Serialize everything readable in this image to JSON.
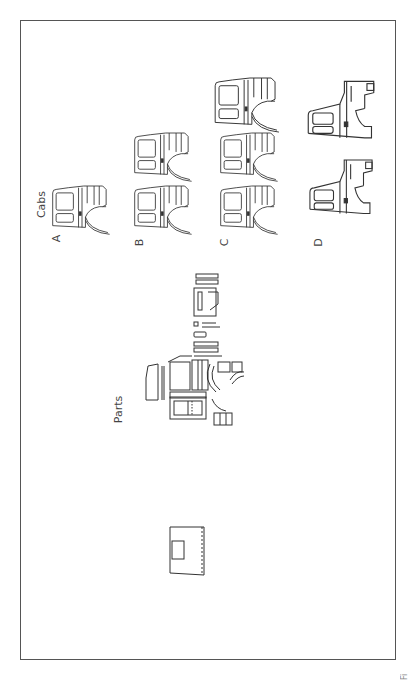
{
  "figure": {
    "cabs_title": "Cabs",
    "parts_title": "Parts",
    "rows": [
      {
        "label": "A",
        "count": 1
      },
      {
        "label": "B",
        "count": 2
      },
      {
        "label": "C",
        "count": 3
      },
      {
        "label": "D",
        "count": 2
      }
    ],
    "caption": "Fi"
  },
  "colors": {
    "line": "#333333",
    "frame": "#555555",
    "background": "#ffffff"
  }
}
